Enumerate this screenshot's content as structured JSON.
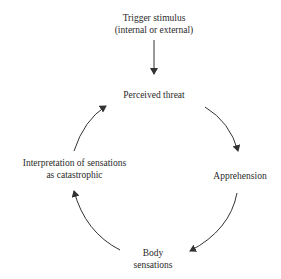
{
  "diagram": {
    "nodes": [
      {
        "id": "trigger",
        "line1": "Trigger stimulus",
        "line2": "(internal or external)"
      },
      {
        "id": "threat",
        "line1": "Perceived threat"
      },
      {
        "id": "apprehension",
        "line1": "Apprehension"
      },
      {
        "id": "body",
        "line1": "Body",
        "line2": "sensations"
      },
      {
        "id": "interpretation",
        "line1": "Interpretation of sensations",
        "line2": "as catastrophic"
      }
    ],
    "edges": [
      {
        "from": "trigger",
        "to": "threat",
        "style": "straight"
      },
      {
        "from": "threat",
        "to": "apprehension",
        "style": "curved"
      },
      {
        "from": "apprehension",
        "to": "body",
        "style": "curved"
      },
      {
        "from": "body",
        "to": "interpretation",
        "style": "curved"
      },
      {
        "from": "interpretation",
        "to": "threat",
        "style": "curved"
      }
    ],
    "colors": {
      "text": "#2a2a2a",
      "arrow": "#333333",
      "background": "#ffffff"
    }
  }
}
